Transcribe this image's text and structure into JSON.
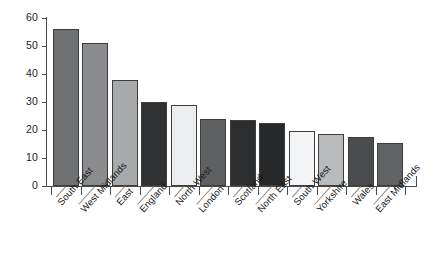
{
  "chart_data": {
    "type": "bar",
    "title": "",
    "subtitle": "",
    "xlabel": "",
    "ylabel": "",
    "ylim": [
      0,
      60
    ],
    "yticks": [
      0,
      10,
      20,
      30,
      40,
      50,
      60
    ],
    "grid": false,
    "legend": "none",
    "categories": [
      "South East",
      "West Midlands",
      "East",
      "England",
      "North West",
      "London",
      "Scotland",
      "North East",
      "South West",
      "Yorkshire",
      "Wales",
      "East Midlands"
    ],
    "values": [
      56,
      51,
      38,
      30,
      29,
      24,
      23.5,
      22.5,
      19.5,
      18.5,
      17.5,
      15.5
    ],
    "bar_colors": [
      "#6f7173",
      "#8a8c8e",
      "#a7a9ab",
      "#2f3133",
      "#eceef0",
      "#5e6062",
      "#2b2d2f",
      "#262829",
      "#f4f5f6",
      "#b9bbbd",
      "#4a4c4e",
      "#606264",
      "#85878a"
    ],
    "bar_border_color": "#3d3d3d",
    "axis_color": "#4a4a4a",
    "background_color": "#ffffff",
    "text_color": "#1a1a1a"
  }
}
